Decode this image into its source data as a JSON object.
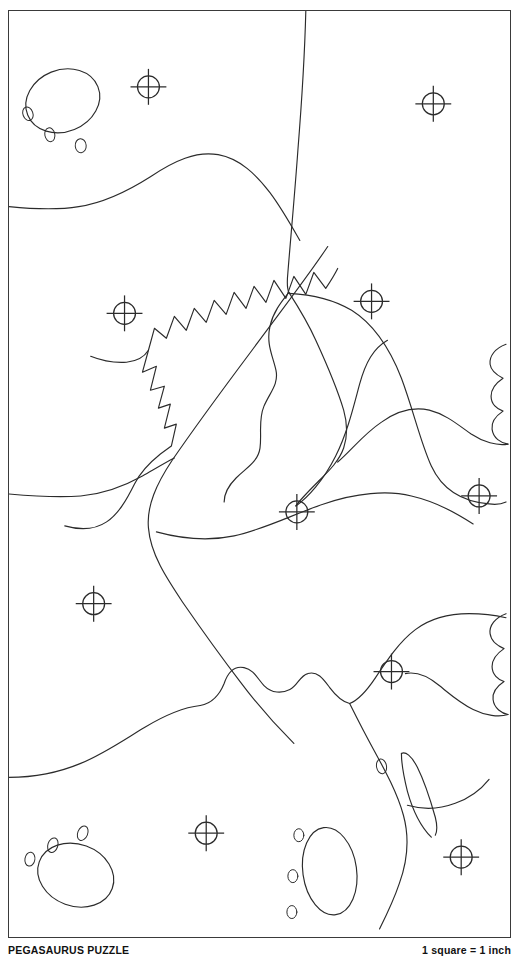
{
  "page": {
    "width": 519,
    "height": 958,
    "background_color": "#ffffff",
    "ink_color": "#2b2b2b",
    "frame_color": "#3a3a3a"
  },
  "caption": {
    "title": "PEGASAURUS PUZZLE",
    "scale_note": "1 square = 1 inch"
  },
  "frame": {
    "x": 8,
    "y": 10,
    "width": 503,
    "height": 928,
    "stroke_width": 1.5
  },
  "registration_marks": {
    "symbol_name": "crosshair-target",
    "circle_radius": 11,
    "tick_overhang": 7,
    "count": 10,
    "positions": [
      {
        "id": "reg-1",
        "x": 148,
        "y": 86
      },
      {
        "id": "reg-2",
        "x": 434,
        "y": 103
      },
      {
        "id": "reg-3",
        "x": 124,
        "y": 313
      },
      {
        "id": "reg-4",
        "x": 372,
        "y": 301
      },
      {
        "id": "reg-5",
        "x": 297,
        "y": 512
      },
      {
        "id": "reg-6",
        "x": 480,
        "y": 496
      },
      {
        "id": "reg-7",
        "x": 93,
        "y": 604
      },
      {
        "id": "reg-8",
        "x": 392,
        "y": 672
      },
      {
        "id": "reg-9",
        "x": 206,
        "y": 834
      },
      {
        "id": "reg-10",
        "x": 462,
        "y": 858
      }
    ]
  },
  "paw_prints": [
    {
      "id": "paw-top-left",
      "label": "three-toed paw print, toes lower-left",
      "pad": {
        "cx": 62,
        "cy": 100,
        "rx": 38,
        "ry": 31,
        "rotation": -22
      },
      "toes": [
        {
          "cx": 27,
          "cy": 113,
          "rx": 5,
          "ry": 7,
          "rotation": -20
        },
        {
          "cx": 49,
          "cy": 134,
          "rx": 5,
          "ry": 7,
          "rotation": -12
        },
        {
          "cx": 80,
          "cy": 145,
          "rx": 5.5,
          "ry": 7,
          "rotation": -5
        }
      ]
    },
    {
      "id": "paw-bottom-left",
      "label": "three-toed paw print, toes upper-left",
      "pad": {
        "cx": 75,
        "cy": 876,
        "rx": 39,
        "ry": 31,
        "rotation": 20
      },
      "toes": [
        {
          "cx": 29,
          "cy": 860,
          "rx": 5,
          "ry": 7,
          "rotation": 10
        },
        {
          "cx": 52,
          "cy": 846,
          "rx": 5,
          "ry": 7.5,
          "rotation": 18
        },
        {
          "cx": 82,
          "cy": 834,
          "rx": 5,
          "ry": 7.5,
          "rotation": 22
        }
      ]
    },
    {
      "id": "paw-bottom-right",
      "label": "three-toed paw print, toes on left side",
      "pad": {
        "cx": 330,
        "cy": 872,
        "rx": 27,
        "ry": 44,
        "rotation": -8
      },
      "toes": [
        {
          "cx": 299,
          "cy": 836,
          "rx": 5,
          "ry": 6.5,
          "rotation": 0
        },
        {
          "cx": 293,
          "cy": 877,
          "rx": 5,
          "ry": 6.5,
          "rotation": 0
        },
        {
          "cx": 292,
          "cy": 913,
          "rx": 5,
          "ry": 6.5,
          "rotation": 0
        }
      ]
    }
  ],
  "creature": {
    "name": "pegasaurus",
    "features": [
      {
        "id": "spiked-back-ridge",
        "description": "zigzag sawtooth crest running diagonally through the middle of the sheet"
      },
      {
        "id": "scalloped-toes-upper-right",
        "description": "three-lobed scalloped foot at the right edge, upper half"
      },
      {
        "id": "scalloped-toes-lower-right",
        "description": "three-lobed scalloped foot at the right edge, lower half"
      },
      {
        "id": "eye",
        "description": "small oval eye on the snout"
      },
      {
        "id": "horn",
        "description": "long curved tapering horn near the snout"
      },
      {
        "id": "neck-contour",
        "description": "long sweeping neck line entering from the top edge"
      }
    ]
  },
  "legend": {
    "grid_unit_note": "1 square = 1 inch"
  }
}
